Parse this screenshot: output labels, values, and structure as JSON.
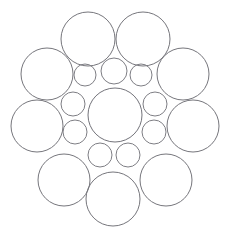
{
  "figure": {
    "type": "geometric-diagram",
    "canvas": {
      "width": 226,
      "height": 231,
      "background": "#ffffff"
    },
    "style": {
      "stroke_color": "#76767c",
      "stroke_width": 1,
      "fill": "none"
    },
    "circles": [
      {
        "name": "center-circle",
        "role": "center",
        "size": "large",
        "cx": 115,
        "cy": 115,
        "r": 27
      },
      {
        "name": "outer-circle-top-left",
        "role": "outer",
        "size": "large",
        "cx": 88,
        "cy": 39,
        "r": 27
      },
      {
        "name": "outer-circle-top-right",
        "role": "outer",
        "size": "large",
        "cx": 143,
        "cy": 39,
        "r": 27
      },
      {
        "name": "outer-circle-upper-left",
        "role": "outer",
        "size": "large",
        "cx": 47,
        "cy": 74,
        "r": 26
      },
      {
        "name": "outer-circle-upper-right",
        "role": "outer",
        "size": "large",
        "cx": 183,
        "cy": 74,
        "r": 26
      },
      {
        "name": "outer-circle-lower-left",
        "role": "outer",
        "size": "large",
        "cx": 37,
        "cy": 126,
        "r": 26
      },
      {
        "name": "outer-circle-lower-right",
        "role": "outer",
        "size": "large",
        "cx": 193,
        "cy": 126,
        "r": 26
      },
      {
        "name": "outer-circle-bottom-left",
        "role": "outer",
        "size": "large",
        "cx": 64,
        "cy": 180,
        "r": 26
      },
      {
        "name": "outer-circle-bottom-right",
        "role": "outer",
        "size": "large",
        "cx": 166,
        "cy": 180,
        "r": 26
      },
      {
        "name": "outer-circle-bottom",
        "role": "outer",
        "size": "large",
        "cx": 113,
        "cy": 199,
        "r": 27
      },
      {
        "name": "inner-circle-top",
        "role": "interstitial",
        "size": "small",
        "cx": 114,
        "cy": 71,
        "r": 13
      },
      {
        "name": "inner-circle-top-left",
        "role": "interstitial",
        "size": "small",
        "cx": 85,
        "cy": 75,
        "r": 11
      },
      {
        "name": "inner-circle-top-right",
        "role": "interstitial",
        "size": "small",
        "cx": 141,
        "cy": 75,
        "r": 11
      },
      {
        "name": "inner-circle-left-upper",
        "role": "interstitial",
        "size": "small",
        "cx": 73,
        "cy": 104,
        "r": 12
      },
      {
        "name": "inner-circle-right-upper",
        "role": "interstitial",
        "size": "small",
        "cx": 155,
        "cy": 104,
        "r": 12
      },
      {
        "name": "inner-circle-left-lower",
        "role": "interstitial",
        "size": "small",
        "cx": 75,
        "cy": 132,
        "r": 12
      },
      {
        "name": "inner-circle-right-lower",
        "role": "interstitial",
        "size": "small",
        "cx": 154,
        "cy": 132,
        "r": 12
      },
      {
        "name": "inner-circle-bottom-left",
        "role": "interstitial",
        "size": "small",
        "cx": 100,
        "cy": 155,
        "r": 12
      },
      {
        "name": "inner-circle-bottom-right",
        "role": "interstitial",
        "size": "small",
        "cx": 128,
        "cy": 155,
        "r": 12
      }
    ],
    "counts": {
      "total": 19,
      "large": 10,
      "small": 9
    }
  }
}
